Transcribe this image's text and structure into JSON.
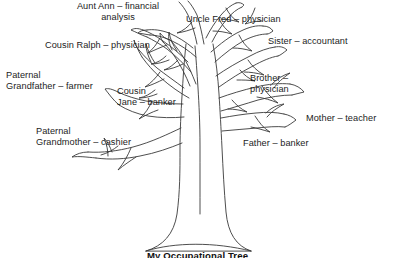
{
  "diagram": {
    "type": "occupational-family-tree",
    "title": "My Occupational Tree",
    "background_color": "#ffffff",
    "line_color": "#3a3a3a",
    "text_color": "#1c1c1c",
    "labels": [
      {
        "id": "aunt-ann",
        "text": "Aunt Ann – financial\nanalysis",
        "relation": "Aunt Ann",
        "occupation": "financial analysis"
      },
      {
        "id": "uncle-fred",
        "text": "Uncle Fred – physician",
        "relation": "Uncle Fred",
        "occupation": "physician"
      },
      {
        "id": "cousin-ralph",
        "text": "Cousin Ralph – physician",
        "relation": "Cousin Ralph",
        "occupation": "physician"
      },
      {
        "id": "sister",
        "text": "Sister – accountant",
        "relation": "Sister",
        "occupation": "accountant"
      },
      {
        "id": "paternal-grandfather",
        "text": "Paternal\nGrandfather – farmer",
        "relation": "Paternal Grandfather",
        "occupation": "farmer"
      },
      {
        "id": "cousin-jane",
        "text": "Cousin\nJane – banker",
        "relation": "Cousin Jane",
        "occupation": "banker"
      },
      {
        "id": "brother",
        "text": "Brother –\nphysician",
        "relation": "Brother",
        "occupation": "physician"
      },
      {
        "id": "mother",
        "text": "Mother – teacher",
        "relation": "Mother",
        "occupation": "teacher"
      },
      {
        "id": "paternal-grandmother",
        "text": "Paternal\nGrandmother – cashier",
        "relation": "Paternal Grandmother",
        "occupation": "cashier"
      },
      {
        "id": "father",
        "text": "Father – banker",
        "relation": "Father",
        "occupation": "banker"
      }
    ]
  }
}
